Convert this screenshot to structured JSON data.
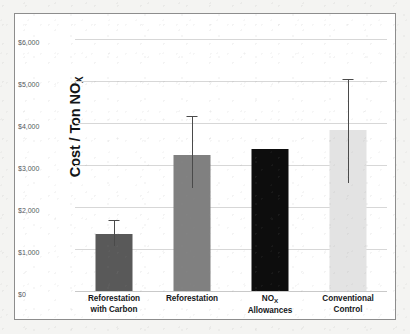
{
  "chart_data": {
    "type": "bar",
    "title": "",
    "xlabel": "",
    "ylabel": "Cost / Ton NOx",
    "ylabel_main": "Cost / Ton NO",
    "ylabel_sub": "X",
    "ylim": [
      0,
      6000
    ],
    "ytick_values": [
      0,
      1000,
      2000,
      3000,
      4000,
      5000,
      6000
    ],
    "ytick_labels": [
      "$0",
      "$1,000",
      "$2,000",
      "$3,000",
      "$4,000",
      "$5,000",
      "$6,000"
    ],
    "grid": true,
    "legend": false,
    "categories": [
      "Reforestation with Carbon",
      "Reforestation",
      "NOx Allowances",
      "Conventional Control"
    ],
    "values": [
      1350,
      3230,
      3380,
      3830
    ],
    "error_low": [
      1060,
      2450,
      null,
      2570
    ],
    "error_high": [
      1700,
      4160,
      null,
      5050
    ],
    "bars": [
      {
        "label_line1": "Reforestation",
        "label_line2": "with Carbon",
        "label_sub": "",
        "value": 1350,
        "error_low": 1060,
        "error_high": 1700,
        "has_error": true,
        "color": "#595959"
      },
      {
        "label_line1": "Reforestation",
        "label_line2": "",
        "label_sub": "",
        "value": 3230,
        "error_low": 2450,
        "error_high": 4160,
        "has_error": true,
        "color": "#808080"
      },
      {
        "label_line1": "NO",
        "label_line2": "Allowances",
        "label_sub": "X",
        "value": 3380,
        "error_low": null,
        "error_high": null,
        "has_error": false,
        "color": "#0d0d0d"
      },
      {
        "label_line1": "Conventional",
        "label_line2": "Control",
        "label_sub": "",
        "value": 3830,
        "error_low": 2570,
        "error_high": 5050,
        "has_error": true,
        "color": "#e3e3e3"
      }
    ],
    "colors": {
      "bar_dark_gray": "#595959",
      "bar_medium_gray": "#808080",
      "bar_black": "#0d0d0d",
      "bar_light_gray": "#e3e3e3",
      "gridline": "#d7d7d7",
      "error_bar": "#4a4a4a",
      "plot_background": "#ffffff",
      "frame_border": "#8d8d8d",
      "page_background": "#f4f4f2",
      "tick_text": "#55585c",
      "axis_title_text": "#121416"
    }
  }
}
